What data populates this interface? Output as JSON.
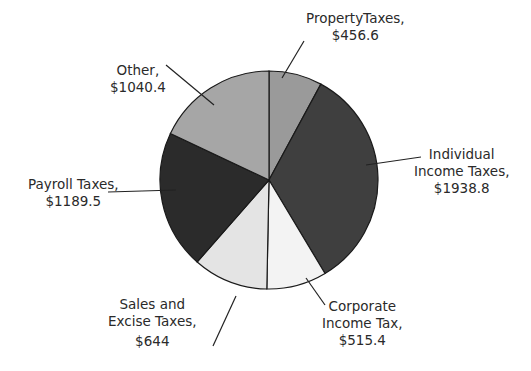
{
  "chart_data": {
    "type": "pie",
    "title": "",
    "start_angle_deg": 0,
    "direction": "clockwise",
    "slices": [
      {
        "name": "PropertyTaxes",
        "value": 456.6,
        "label_lines": [
          "PropertyTaxes,",
          "$456.6"
        ],
        "color": "#9a9a9a"
      },
      {
        "name": "Individual Income Taxes",
        "value": 1938.8,
        "label_lines": [
          "Individual",
          "Income Taxes,",
          "$1938.8"
        ],
        "color": "#3f3f3f"
      },
      {
        "name": "Corporate Income Tax",
        "value": 515.4,
        "label_lines": [
          "Corporate",
          "Income Tax,",
          "$515.4"
        ],
        "color": "#f3f3f3"
      },
      {
        "name": "Sales and Excise Taxes",
        "value": 644,
        "label_lines": [
          "Sales and",
          "Excise Taxes,",
          "$644"
        ],
        "color": "#e4e4e4"
      },
      {
        "name": "Payroll Taxes",
        "value": 1189.5,
        "label_lines": [
          "Payroll Taxes,",
          "$1189.5"
        ],
        "color": "#2b2b2b"
      },
      {
        "name": "Other",
        "value": 1040.4,
        "label_lines": [
          "Other,",
          "$1040.4"
        ],
        "color": "#a6a6a6"
      }
    ],
    "units": "$"
  },
  "labels": {
    "property": {
      "l1": "PropertyTaxes,",
      "l2": "$456.6"
    },
    "individual": {
      "l1": "Individual",
      "l2": "Income Taxes,",
      "l3": "$1938.8"
    },
    "corporate": {
      "l1": "Corporate",
      "l2": "Income Tax,",
      "l3": "$515.4"
    },
    "sales": {
      "l1": "Sales and",
      "l2": "Excise Taxes,",
      "l3": "$644"
    },
    "payroll": {
      "l1": "Payroll Taxes,",
      "l2": "$1189.5"
    },
    "other": {
      "l1": "Other,",
      "l2": "$1040.4"
    }
  }
}
